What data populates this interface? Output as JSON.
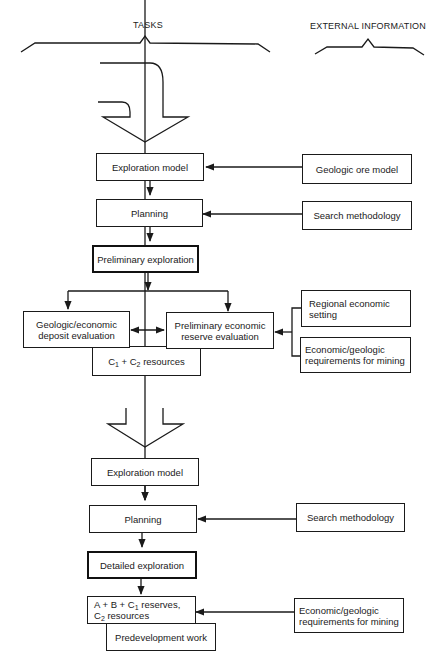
{
  "headers": {
    "tasks": "TASKS",
    "external": "EXTERNAL INFORMATION"
  },
  "stage1": {
    "exploration_model": "Exploration model",
    "planning": "Planning",
    "preliminary_exploration": "Preliminary exploration",
    "geologic_economic_eval": [
      "Geologic/economic",
      "deposit evaluation"
    ],
    "preliminary_economic_eval": [
      "Preliminary economic",
      "reserve evaluation"
    ],
    "resources": {
      "a": "C",
      "a_sub": "1",
      "mid": " + C",
      "b_sub": "2",
      "tail": " resources"
    }
  },
  "stage1_external": {
    "geologic_ore_model": "Geologic ore model",
    "search_methodology": "Search methodology",
    "regional_economic": [
      "Regional economic",
      "setting"
    ],
    "economic_geologic_req": [
      "Economic/geologic",
      "requirements for mining"
    ]
  },
  "stage2": {
    "exploration_model": "Exploration model",
    "planning": "Planning",
    "detailed_exploration": "Detailed exploration",
    "reserves": {
      "p1": "A + B + C",
      "s1": "1",
      "p2": " reserves,",
      "p3": "C",
      "s2": "2",
      "p4": " resources"
    },
    "predevelopment": "Predevelopment work"
  },
  "stage2_external": {
    "search_methodology": "Search methodology",
    "economic_geologic_req": [
      "Economic/geologic",
      "requirements for mining"
    ]
  }
}
